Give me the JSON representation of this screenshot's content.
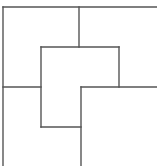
{
  "diagram": {
    "type": "line-drawing",
    "stroke_color": "#555555",
    "background": "#ffffff",
    "stroke_width": 1.4,
    "lines": [
      {
        "id": "outer-top",
        "x1": 3,
        "y1": 7,
        "x2": 157,
        "y2": 7
      },
      {
        "id": "outer-left",
        "x1": 3,
        "y1": 7,
        "x2": 3,
        "y2": 166
      },
      {
        "id": "top-divider",
        "x1": 79,
        "y1": 7,
        "x2": 79,
        "y2": 47
      },
      {
        "id": "inner-top",
        "x1": 41,
        "y1": 47,
        "x2": 119,
        "y2": 47
      },
      {
        "id": "inner-right",
        "x1": 119,
        "y1": 47,
        "x2": 119,
        "y2": 87
      },
      {
        "id": "left-horizontal",
        "x1": 3,
        "y1": 87,
        "x2": 41,
        "y2": 87
      },
      {
        "id": "right-horizontal",
        "x1": 81,
        "y1": 87,
        "x2": 157,
        "y2": 87
      },
      {
        "id": "inner-left",
        "x1": 41,
        "y1": 47,
        "x2": 41,
        "y2": 127
      },
      {
        "id": "inner-bottom",
        "x1": 41,
        "y1": 127,
        "x2": 81,
        "y2": 127
      },
      {
        "id": "middle-vertical",
        "x1": 81,
        "y1": 87,
        "x2": 81,
        "y2": 166
      }
    ]
  }
}
